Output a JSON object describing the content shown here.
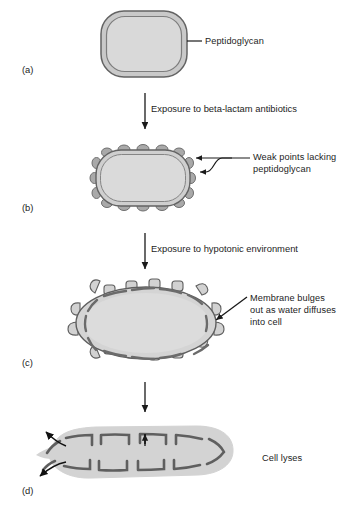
{
  "figure": {
    "title_visible": false,
    "background_color": "#ffffff",
    "panels": [
      {
        "id": "a",
        "letter": "(a)",
        "letter_x": 22,
        "letter_y": 64,
        "description": "intact rod-shaped bacterial cell with continuous peptidoglycan wall",
        "label": {
          "text": "Peptidoglycan",
          "lines": [
            "Peptidoglycan"
          ],
          "x": 205,
          "y": 36,
          "leader": "horizontal-line"
        }
      },
      {
        "id": "b",
        "letter": "(b)",
        "letter_x": 22,
        "letter_y": 202,
        "description": "cell with darker bumps around perimeter marking weak points",
        "label": {
          "text": "Weak points lacking peptidoglycan",
          "lines": [
            "Weak points lacking",
            "peptidoglycan"
          ],
          "x": 253,
          "y": 155,
          "leader": "forked-two-arrows"
        }
      },
      {
        "id": "c",
        "letter": "(c)",
        "letter_x": 22,
        "letter_y": 357,
        "description": "swollen elliptical cell with membrane knobs bulging outward between peptidoglycan arcs",
        "label": {
          "text": "Membrane bulges out as water diffuses into cell",
          "lines": [
            "Membrane bulges",
            "out as water diffuses",
            "into cell"
          ],
          "x": 250,
          "y": 296,
          "leader": "diagonal-arrow"
        }
      },
      {
        "id": "d",
        "letter": "(d)",
        "letter_x": 22,
        "letter_y": 485,
        "description": "ruptured flattened cell with contents escaping through break on left",
        "label": {
          "text": "Cell lyses",
          "lines": [
            "Cell lyses"
          ],
          "x": 262,
          "y": 457,
          "leader": "none"
        }
      }
    ],
    "transitions": [
      {
        "id": "a-to-b",
        "text": "Exposure to beta-lactam antibiotics",
        "arrow_x": 145,
        "arrow_y_start": 93,
        "arrow_y_end": 133,
        "text_x": 151,
        "text_y": 107
      },
      {
        "id": "b-to-c",
        "text": "Exposure to hypotonic environment",
        "arrow_x": 145,
        "arrow_y_start": 233,
        "arrow_y_end": 273,
        "text_x": 151,
        "text_y": 247
      },
      {
        "id": "c-to-d",
        "text": "",
        "arrow_x": 145,
        "arrow_y_start": 382,
        "arrow_y_end": 416,
        "text_x": 151,
        "text_y": 396
      }
    ],
    "colors": {
      "cytoplasm_fill": "#d2d2d2",
      "cytoplasm_fill_light": "#d9d9d9",
      "wall_stroke": "#6f6f6f",
      "wall_dark": "#8a8a8a",
      "weak_point_fill": "#a8a8a8",
      "outline": "#3a3a3a",
      "text": "#1c1c1c",
      "arrow": "#1a1a1a",
      "background": "#ffffff"
    }
  }
}
